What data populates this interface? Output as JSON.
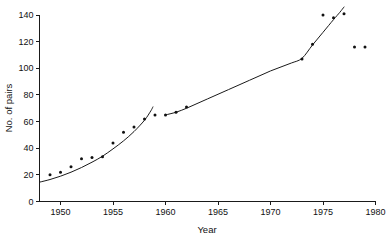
{
  "chart_data": {
    "type": "scatter",
    "title": "",
    "xlabel": "Year",
    "ylabel": "No. of pairs",
    "xlim": [
      1948,
      1980
    ],
    "ylim": [
      0,
      140
    ],
    "grid": false,
    "legend": null,
    "xticks": [
      1950,
      1955,
      1960,
      1965,
      1970,
      1975,
      1980
    ],
    "xtick_labels": [
      "1950",
      "1955",
      "1960",
      "1965",
      "1970",
      "1975",
      "1980"
    ],
    "yticks": [
      0,
      20,
      40,
      60,
      80,
      100,
      120,
      140
    ],
    "ytick_labels": [
      "0",
      "20",
      "40",
      "60",
      "80",
      "100",
      "120",
      "140"
    ],
    "points": [
      {
        "x": 1949,
        "y": 20
      },
      {
        "x": 1950,
        "y": 22
      },
      {
        "x": 1951,
        "y": 26
      },
      {
        "x": 1952,
        "y": 32
      },
      {
        "x": 1953,
        "y": 33
      },
      {
        "x": 1954,
        "y": 33.5
      },
      {
        "x": 1955,
        "y": 44
      },
      {
        "x": 1956,
        "y": 52
      },
      {
        "x": 1957,
        "y": 56
      },
      {
        "x": 1958,
        "y": 62
      },
      {
        "x": 1959,
        "y": 65
      },
      {
        "x": 1960,
        "y": 65
      },
      {
        "x": 1961,
        "y": 67
      },
      {
        "x": 1962,
        "y": 71
      },
      {
        "x": 1973,
        "y": 107
      },
      {
        "x": 1974,
        "y": 118
      },
      {
        "x": 1975,
        "y": 140
      },
      {
        "x": 1976,
        "y": 138
      },
      {
        "x": 1977,
        "y": 141
      },
      {
        "x": 1978,
        "y": 116
      },
      {
        "x": 1979,
        "y": 116
      }
    ],
    "fitted_curves": [
      {
        "name": "early-exponential-fit",
        "points": [
          {
            "x": 1948.0,
            "y": 14.5
          },
          {
            "x": 1949.0,
            "y": 16.5
          },
          {
            "x": 1950.0,
            "y": 19.0
          },
          {
            "x": 1951.0,
            "y": 22.0
          },
          {
            "x": 1952.0,
            "y": 25.5
          },
          {
            "x": 1953.0,
            "y": 29.5
          },
          {
            "x": 1954.0,
            "y": 34.0
          },
          {
            "x": 1955.0,
            "y": 39.5
          },
          {
            "x": 1956.0,
            "y": 45.5
          },
          {
            "x": 1957.0,
            "y": 52.5
          },
          {
            "x": 1958.0,
            "y": 61.0
          },
          {
            "x": 1958.6,
            "y": 68.0
          },
          {
            "x": 1958.8,
            "y": 71.0
          }
        ]
      },
      {
        "name": "late-exponential-fit",
        "points": [
          {
            "x": 1960.0,
            "y": 65.0
          },
          {
            "x": 1961.0,
            "y": 67.0
          },
          {
            "x": 1962.0,
            "y": 70.0
          },
          {
            "x": 1963.0,
            "y": 73.5
          },
          {
            "x": 1964.0,
            "y": 77.0
          },
          {
            "x": 1965.0,
            "y": 80.5
          },
          {
            "x": 1966.0,
            "y": 84.0
          },
          {
            "x": 1967.0,
            "y": 87.5
          },
          {
            "x": 1968.0,
            "y": 91.0
          },
          {
            "x": 1969.0,
            "y": 94.5
          },
          {
            "x": 1970.0,
            "y": 98.0
          },
          {
            "x": 1971.0,
            "y": 101.0
          },
          {
            "x": 1972.0,
            "y": 104.0
          },
          {
            "x": 1973.0,
            "y": 107.5
          },
          {
            "x": 1974.0,
            "y": 117.5
          },
          {
            "x": 1975.0,
            "y": 127.0
          },
          {
            "x": 1976.0,
            "y": 136.5
          },
          {
            "x": 1976.6,
            "y": 142.0
          },
          {
            "x": 1977.0,
            "y": 146.0
          }
        ]
      }
    ]
  },
  "axes": {
    "x_title": "Year",
    "y_title": "No. of pairs"
  },
  "colors": {
    "ink": "#1a1a1a",
    "background": "#ffffff",
    "point": "#111111"
  }
}
